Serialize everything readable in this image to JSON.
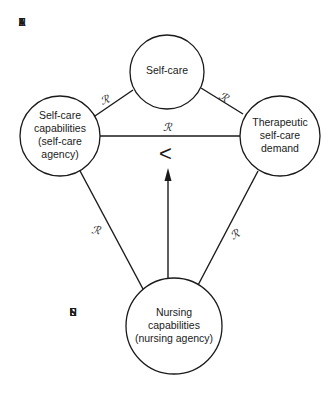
{
  "side_labels": {
    "patient": [
      "P",
      "A",
      "T",
      "I",
      "E",
      "N",
      "T"
    ],
    "nurse": [
      "N",
      "U",
      "R",
      "S",
      "E"
    ]
  },
  "nodes": {
    "self_care": [
      "Self-care"
    ],
    "self_care_capabilities": [
      "Self-care",
      "capabilities",
      "(self-care",
      "agency)"
    ],
    "therapeutic_demand": [
      "Therapeutic",
      "self-care",
      "demand"
    ],
    "nursing_capabilities": [
      "Nursing",
      "capabilities",
      "(nursing agency)"
    ]
  },
  "relation_symbol": "ℛ",
  "comparison_symbol": "<",
  "colors": {
    "stroke": "#1a1a1a",
    "background": "#ffffff"
  }
}
